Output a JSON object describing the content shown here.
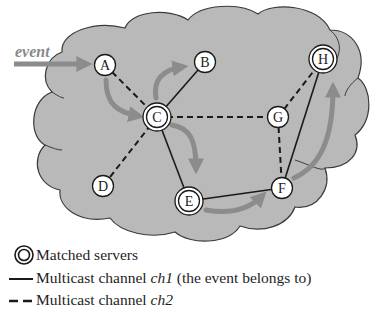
{
  "diagram": {
    "event_label": "event",
    "colors": {
      "cloud_fill": "#b9b9b9",
      "cloud_stroke": "#3a3a3a",
      "arrow": "#8c8c8c",
      "edge": "#1a1a1a",
      "node_fill": "#ffffff"
    },
    "nodes": [
      {
        "id": "A",
        "label": "A",
        "x": 105,
        "y": 65,
        "matched": false
      },
      {
        "id": "B",
        "label": "B",
        "x": 205,
        "y": 62,
        "matched": false
      },
      {
        "id": "C",
        "label": "C",
        "x": 157,
        "y": 117,
        "matched": true
      },
      {
        "id": "D",
        "label": "D",
        "x": 103,
        "y": 186,
        "matched": false
      },
      {
        "id": "E",
        "label": "E",
        "x": 189,
        "y": 201,
        "matched": true
      },
      {
        "id": "F",
        "label": "F",
        "x": 282,
        "y": 188,
        "matched": false
      },
      {
        "id": "G",
        "label": "G",
        "x": 278,
        "y": 117,
        "matched": false
      },
      {
        "id": "H",
        "label": "H",
        "x": 323,
        "y": 59,
        "matched": true
      }
    ],
    "edges_ch1_solid": [
      [
        "C",
        "B"
      ],
      [
        "C",
        "E"
      ],
      [
        "E",
        "F"
      ],
      [
        "F",
        "H"
      ]
    ],
    "edges_ch2_dashed": [
      [
        "A",
        "C"
      ],
      [
        "C",
        "D"
      ],
      [
        "C",
        "G"
      ],
      [
        "G",
        "F"
      ],
      [
        "G",
        "H"
      ]
    ],
    "event_path": [
      "event→A",
      "A→C",
      "C→B",
      "C→E",
      "E→F",
      "F→H"
    ]
  },
  "legend": {
    "matched": "Matched servers",
    "ch1_prefix": "Multicast channel ",
    "ch1_name": "ch1",
    "ch1_suffix": " (the event belongs to)",
    "ch2_prefix": "Multicast channel ",
    "ch2_name": "ch2"
  }
}
